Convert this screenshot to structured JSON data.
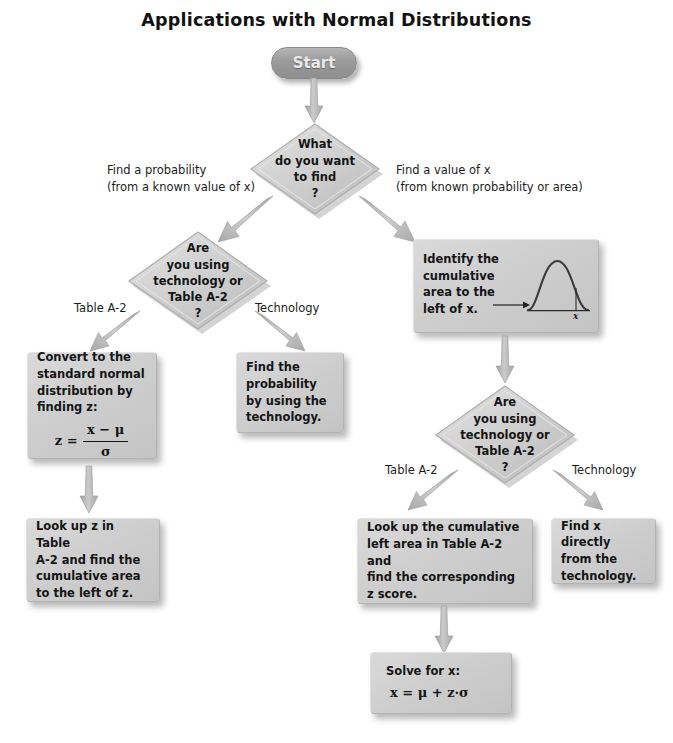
{
  "title": "Applications with Normal Distributions",
  "start": {
    "label": "Start"
  },
  "decisions": {
    "what_to_find": {
      "lines": [
        "What",
        "do you want",
        "to find",
        "?"
      ]
    },
    "tech_or_table_left": {
      "lines": [
        "Are",
        "you using",
        "technology or",
        "Table A-2",
        "?"
      ]
    },
    "tech_or_table_right": {
      "lines": [
        "Are",
        "you using",
        "technology or",
        "Table A-2",
        "?"
      ]
    }
  },
  "edge_labels": {
    "find_probability_l1": "Find a probability",
    "find_probability_l2": "(from a known value of x)",
    "find_value_l1": "Find a value of x",
    "find_value_l2": "(from known probability or area)",
    "table_a2_left": "Table A-2",
    "technology_left": "Technology",
    "table_a2_right": "Table A-2",
    "technology_right": "Technology"
  },
  "boxes": {
    "convert_z": {
      "lines": [
        "Convert to the",
        "standard normal",
        "distribution by",
        "finding z:"
      ],
      "formula": {
        "lhs": "z =",
        "numerator": "x − μ",
        "denominator": "σ"
      }
    },
    "find_probability_tech": {
      "lines": [
        "Find the",
        "probability",
        "by using the",
        "technology."
      ]
    },
    "identify_cumulative": {
      "lines": [
        "Identify the",
        "cumulative",
        "area to the",
        "left of x."
      ],
      "curve_x_tick": "x"
    },
    "lookup_z": {
      "lines": [
        "Look up z in Table",
        "A-2 and find the",
        "cumulative area",
        "to the left of z."
      ]
    },
    "lookup_area": {
      "lines": [
        "Look up the cumulative",
        "left area in Table A-2 and",
        "find the corresponding",
        " z score."
      ]
    },
    "find_x_tech": {
      "lines": [
        "Find x directly",
        "from the",
        "technology."
      ]
    },
    "solve_for_x": {
      "lines": [
        "Solve for x:"
      ],
      "formula": "x = μ + z·σ"
    }
  },
  "colors": {
    "node_fill": "#cfcfcf",
    "node_fill_light": "#dadada",
    "node_border": "#b3b3b3",
    "start_fill": "#9b9b9b",
    "arrow_fill": "#b6b6b6",
    "text": "#141414",
    "background": "#ffffff"
  },
  "icons": {
    "normal_curve": "bell-curve-icon",
    "pointer": "right-arrow-icon"
  }
}
